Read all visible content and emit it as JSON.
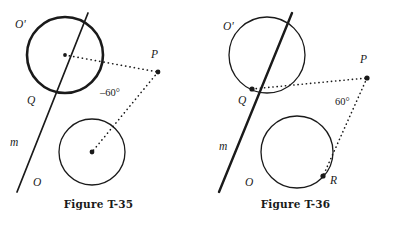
{
  "page": {
    "background_color": "#ffffff",
    "ink_color": "#1a1a1a",
    "width": 394,
    "height": 226
  },
  "figures": [
    {
      "id": "figure-t-35",
      "caption": "Figure T-35",
      "labels": {
        "circle_upper": "O'",
        "circle_lower": "O",
        "line": "m",
        "tangency_point": "Q",
        "external_point": "P",
        "angle": "–60°"
      },
      "geometry": {
        "upper_circle": {
          "cx": 65,
          "cy": 55,
          "r": 38,
          "stroke_width": 2.6,
          "bold": true,
          "center_dot": true
        },
        "lower_circle": {
          "cx": 92,
          "cy": 152,
          "r": 33,
          "stroke_width": 1.3,
          "bold": false,
          "center_dot": true
        },
        "line_m": {
          "x1": 17,
          "y1": 192,
          "x2": 88,
          "y2": 13,
          "stroke_width": 1.7
        },
        "point_p": {
          "x": 158,
          "y": 72
        },
        "dotted_segments": [
          {
            "from": "upper_center",
            "to": "point_p"
          },
          {
            "from": "point_p",
            "to": "lower_center"
          }
        ]
      }
    },
    {
      "id": "figure-t-36",
      "caption": "Figure T-36",
      "labels": {
        "circle_upper": "O'",
        "circle_lower": "O",
        "line": "m",
        "tangency_point": "Q",
        "external_point": "P",
        "tangent_point": "R",
        "angle": "60°"
      },
      "geometry": {
        "upper_circle": {
          "cx": 70,
          "cy": 55,
          "r": 38,
          "stroke_width": 1.3,
          "bold": false,
          "center_dot": false
        },
        "lower_circle": {
          "cx": 100,
          "cy": 152,
          "r": 36,
          "stroke_width": 1.3,
          "bold": false,
          "center_dot": false
        },
        "line_m": {
          "x1": 22,
          "y1": 192,
          "x2": 95,
          "y2": 13,
          "stroke_width": 2.4
        },
        "point_q": {
          "x": 55,
          "y": 89
        },
        "point_p": {
          "x": 170,
          "y": 78
        },
        "point_r": {
          "x": 126,
          "y": 176
        },
        "dotted_segments": [
          {
            "from": "point_q",
            "to": "point_p"
          },
          {
            "from": "point_p",
            "to": "point_r"
          }
        ]
      }
    }
  ]
}
